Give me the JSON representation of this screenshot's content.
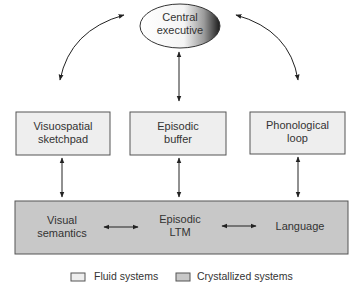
{
  "central": {
    "line1": "Central",
    "line2": "executive"
  },
  "fluid_boxes": [
    {
      "line1": "Visuospatial",
      "line2": "sketchpad"
    },
    {
      "line1": "Episodic",
      "line2": "buffer"
    },
    {
      "line1": "Phonological",
      "line2": "loop"
    }
  ],
  "crystallized": [
    {
      "line1": "Visual",
      "line2": "semantics"
    },
    {
      "line1": "Episodic",
      "line2": "LTM"
    },
    {
      "line1": "Language",
      "line2": ""
    }
  ],
  "legend": {
    "fluid": "Fluid systems",
    "crystallized": "Crystallized systems"
  },
  "colors": {
    "fluid_fill": "#eeeeee",
    "crystallized_fill": "#c8c8c8",
    "stroke": "#555555"
  }
}
